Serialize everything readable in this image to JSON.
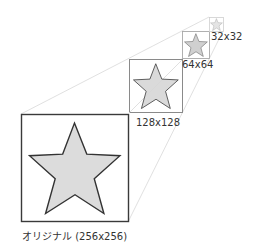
{
  "diagram": {
    "title": "",
    "colors": {
      "star_fill": "#dcdcdc",
      "star_stroke": "#333333",
      "box_stroke_big": "#3a3a3a",
      "box_stroke_mid": "#8a8a8a",
      "box_stroke_small": "#a8a8a8",
      "box_stroke_tiny": "#cfcfcf",
      "guide_line": "#d8d8d8"
    },
    "items": [
      {
        "id": "original",
        "label": "オリジナル (256x256)",
        "size": "256x256"
      },
      {
        "id": "size128",
        "label": "128x128",
        "size": "128x128"
      },
      {
        "id": "size64",
        "label": "64x64",
        "size": "64x64"
      },
      {
        "id": "size32",
        "label": "32x32",
        "size": "32x32"
      }
    ]
  }
}
